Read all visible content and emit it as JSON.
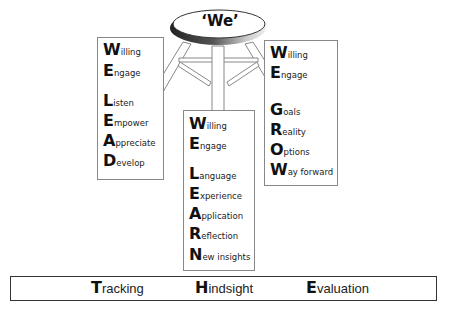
{
  "stool": {
    "seat_label": "‘We’",
    "colors": {
      "seat_fill": "#ffffff",
      "seat_shadow": "#3a3a3a",
      "leg_outline": "#888888"
    }
  },
  "lead_box": {
    "acronym": "WE LEAD",
    "rows": [
      {
        "cap": "W",
        "rest": "illing"
      },
      {
        "cap": "E",
        "rest": "ngage"
      },
      {
        "cap": "L",
        "rest": "isten"
      },
      {
        "cap": "E",
        "rest": "mpower"
      },
      {
        "cap": "A",
        "rest": "ppreciate"
      },
      {
        "cap": "D",
        "rest": "evelop"
      }
    ]
  },
  "grow_box": {
    "acronym": "WE GROW",
    "rows": [
      {
        "cap": "W",
        "rest": "illing"
      },
      {
        "cap": "E",
        "rest": "ngage"
      },
      {
        "cap": "G",
        "rest": "oals"
      },
      {
        "cap": "R",
        "rest": "eality"
      },
      {
        "cap": "O",
        "rest": "ptions"
      },
      {
        "cap": "W",
        "rest": "ay forward"
      }
    ]
  },
  "learn_box": {
    "acronym": "WE LEARN",
    "rows": [
      {
        "cap": "W",
        "rest": "illing"
      },
      {
        "cap": "E",
        "rest": "ngage"
      },
      {
        "cap": "L",
        "rest": "anguage"
      },
      {
        "cap": "E",
        "rest": "xperience"
      },
      {
        "cap": "A",
        "rest": "pplication"
      },
      {
        "cap": "R",
        "rest": "eflection"
      },
      {
        "cap": "N",
        "rest": "ew insights"
      }
    ]
  },
  "footer_bar": {
    "acronym": "THE",
    "items": [
      {
        "cap": "T",
        "rest": "racking"
      },
      {
        "cap": "H",
        "rest": "indsight"
      },
      {
        "cap": "E",
        "rest": "valuation"
      }
    ]
  }
}
